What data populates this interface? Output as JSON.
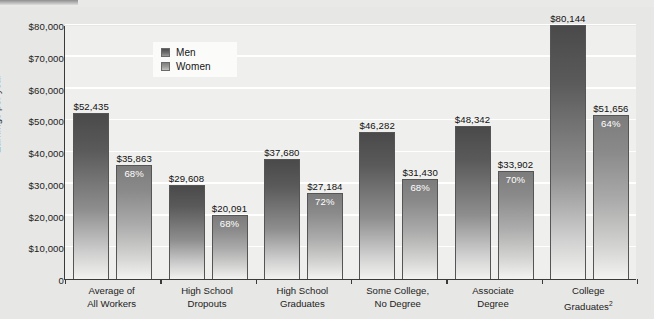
{
  "chart_data": {
    "type": "bar",
    "title": "",
    "subtitle": "",
    "xlabel": "",
    "ylabel": "Earnings per year",
    "ylim": [
      0,
      80000
    ],
    "ytick_labels": [
      "$80,000",
      "$70,000",
      "$60,000",
      "$50,000",
      "$40,000",
      "$30,000",
      "$20,000",
      "$10,000",
      "0"
    ],
    "ytick_values": [
      80000,
      70000,
      60000,
      50000,
      40000,
      30000,
      20000,
      10000,
      0
    ],
    "grid": true,
    "legend_position": "top-left-inside",
    "categories": [
      "Average of\nAll Workers",
      "High School\nDropouts",
      "High School\nGraduates",
      "Some College,\nNo Degree",
      "Associate\nDegree",
      "College\nGraduates"
    ],
    "category_lines": [
      [
        "Average of",
        "All Workers"
      ],
      [
        "High School",
        "Dropouts"
      ],
      [
        "High School",
        "Graduates"
      ],
      [
        "Some College,",
        "No Degree"
      ],
      [
        "Associate",
        "Degree"
      ],
      [
        "College",
        "Graduates"
      ]
    ],
    "category_superscripts": [
      "",
      "",
      "",
      "",
      "",
      "2"
    ],
    "series": [
      {
        "name": "Men",
        "values": [
          52435,
          29608,
          37680,
          46282,
          48342,
          80144
        ],
        "labels": [
          "$52,435",
          "$29,608",
          "$37,680",
          "$46,282",
          "$48,342",
          "$80,144"
        ],
        "pct_labels": [
          "",
          "",
          "",
          "",
          "",
          ""
        ],
        "color": "#4a4a4a"
      },
      {
        "name": "Women",
        "values": [
          35863,
          20091,
          27184,
          31430,
          33902,
          51656
        ],
        "labels": [
          "$35,863",
          "$20,091",
          "$27,184",
          "$31,430",
          "$33,902",
          "$51,656"
        ],
        "pct_labels": [
          "68%",
          "68%",
          "72%",
          "68%",
          "70%",
          "64%"
        ],
        "color": "#8a8a8a"
      }
    ]
  },
  "colors": {
    "page_background": "#e9e9e7",
    "plot_background": "#efefed",
    "gridline": "#ffffff",
    "axis": "#3a3a3a",
    "men_bar": "#4a4a4a",
    "women_bar": "#8a8a8a",
    "value_label": "#111111",
    "pct_label": "#ffffff",
    "legend_background": "#fbfbfa"
  },
  "legend": {
    "items": [
      {
        "label": "Men",
        "swatch": "men-swatch"
      },
      {
        "label": "Women",
        "swatch": "women-swatch"
      }
    ]
  }
}
